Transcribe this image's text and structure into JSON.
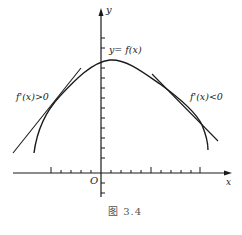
{
  "figure": {
    "y_axis_label": "y",
    "x_axis_label": "x",
    "origin_label": "O",
    "curve_label": "y= f(x)",
    "left_label": "f'(x)>0",
    "right_label": "f'(x)<0",
    "caption": "图 3.4"
  },
  "colors": {
    "stroke": "#1a1a1a",
    "text": "#222222",
    "caption": "#555555"
  }
}
